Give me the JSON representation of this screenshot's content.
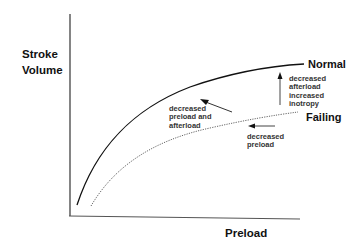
{
  "diagram": {
    "y_axis_label_line1": "Stroke",
    "y_axis_label_line2": "Volume",
    "x_axis_label": "Preload",
    "curves": {
      "normal": {
        "label": "Normal",
        "style": "solid",
        "color": "#111111"
      },
      "failing": {
        "label": "Failing",
        "style": "dotted",
        "color": "#555555"
      }
    },
    "annotations": {
      "upper_left": {
        "line1": "decreased",
        "line2": "preload and",
        "line3": "afterload"
      },
      "right_vertical": {
        "line1": "decreased",
        "line2": "afterload",
        "line3": "increased",
        "line4": "inotropy"
      },
      "lower_right": {
        "line1": "decreased",
        "line2": "preload"
      }
    }
  }
}
